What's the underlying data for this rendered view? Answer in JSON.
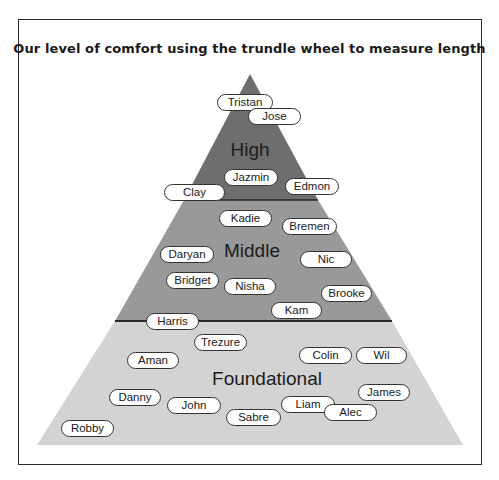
{
  "title": "Our level of comfort using the trundle wheel to measure length",
  "colors": {
    "high": "#6e6e6e",
    "middle": "#999999",
    "foundational": "#d3d3d3",
    "pill_bg": "#ffffff",
    "outline": "#2a2a2a"
  },
  "tiers": [
    {
      "id": "high",
      "label": "High"
    },
    {
      "id": "middle",
      "label": "Middle"
    },
    {
      "id": "foundational",
      "label": "Foundational"
    }
  ],
  "students": [
    {
      "name": "Tristan",
      "tier": "high"
    },
    {
      "name": "Jose",
      "tier": "high"
    },
    {
      "name": "Jazmin",
      "tier": "high"
    },
    {
      "name": "Clay",
      "tier": "high"
    },
    {
      "name": "Edmon",
      "tier": "high"
    },
    {
      "name": "Kadie",
      "tier": "middle"
    },
    {
      "name": "Bremen",
      "tier": "middle"
    },
    {
      "name": "Daryan",
      "tier": "middle"
    },
    {
      "name": "Nic",
      "tier": "middle"
    },
    {
      "name": "Bridget",
      "tier": "middle"
    },
    {
      "name": "Nisha",
      "tier": "middle"
    },
    {
      "name": "Brooke",
      "tier": "middle"
    },
    {
      "name": "Kam",
      "tier": "middle"
    },
    {
      "name": "Harris",
      "tier": "middle"
    },
    {
      "name": "Trezure",
      "tier": "foundational"
    },
    {
      "name": "Aman",
      "tier": "foundational"
    },
    {
      "name": "Colin",
      "tier": "foundational"
    },
    {
      "name": "Wil",
      "tier": "foundational"
    },
    {
      "name": "Danny",
      "tier": "foundational"
    },
    {
      "name": "John",
      "tier": "foundational"
    },
    {
      "name": "James",
      "tier": "foundational"
    },
    {
      "name": "Liam",
      "tier": "foundational"
    },
    {
      "name": "Alec",
      "tier": "foundational"
    },
    {
      "name": "Sabre",
      "tier": "foundational"
    },
    {
      "name": "Robby",
      "tier": "foundational"
    }
  ]
}
